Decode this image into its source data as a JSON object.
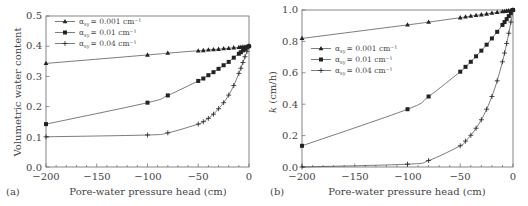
{
  "chart_data": [
    {
      "type": "line",
      "panel_label": "(a)",
      "title": "",
      "xlabel": "Pore-water pressure head (cm)",
      "ylabel": "Volumetric water content",
      "xlim": [
        -200,
        0
      ],
      "ylim": [
        0.0,
        0.5
      ],
      "xticks": [
        "-200",
        "-150",
        "-100",
        "-50",
        "0"
      ],
      "yticks": [
        "0.0",
        "0.1",
        "0.2",
        "0.3",
        "0.4",
        "0.5"
      ],
      "grid": false,
      "legend_position": "upper-left",
      "x": [
        -200,
        -100,
        -80,
        -50,
        -45,
        -40,
        -35,
        -30,
        -25,
        -20,
        -15,
        -10,
        -8,
        -6,
        -4,
        -2,
        0
      ],
      "series": [
        {
          "name": "α_sy = 0.001 cm⁻¹",
          "marker": "triangle",
          "values": [
            0.343,
            0.371,
            0.377,
            0.385,
            0.386,
            0.388,
            0.389,
            0.39,
            0.392,
            0.393,
            0.395,
            0.396,
            0.397,
            0.398,
            0.398,
            0.399,
            0.4
          ]
        },
        {
          "name": "α_sy = 0.01 cm⁻¹",
          "marker": "square",
          "values": [
            0.142,
            0.213,
            0.237,
            0.285,
            0.293,
            0.304,
            0.314,
            0.325,
            0.337,
            0.348,
            0.362,
            0.375,
            0.38,
            0.386,
            0.391,
            0.396,
            0.4
          ]
        },
        {
          "name": "α_sy = 0.04 cm⁻¹",
          "marker": "plus",
          "values": [
            0.1,
            0.106,
            0.113,
            0.142,
            0.15,
            0.161,
            0.175,
            0.193,
            0.213,
            0.238,
            0.27,
            0.31,
            0.327,
            0.346,
            0.365,
            0.383,
            0.4
          ]
        }
      ]
    },
    {
      "type": "line",
      "panel_label": "(b)",
      "title": "",
      "xlabel": "Pore-water pressure head (cm)",
      "ylabel": "k (cm/h)",
      "xlim": [
        -200,
        0
      ],
      "ylim": [
        0.0,
        1.0
      ],
      "xticks": [
        "-200",
        "-150",
        "-100",
        "-50",
        "0"
      ],
      "yticks": [
        "0.0",
        "0.2",
        "0.4",
        "0.6",
        "0.8",
        "1.0"
      ],
      "grid": false,
      "legend_position": "upper-left",
      "x": [
        -200,
        -100,
        -80,
        -50,
        -45,
        -40,
        -35,
        -30,
        -25,
        -20,
        -15,
        -10,
        -8,
        -6,
        -4,
        -2,
        0
      ],
      "series": [
        {
          "name": "α_sy = 0.001 cm⁻¹",
          "marker": "triangle",
          "values": [
            0.819,
            0.905,
            0.923,
            0.951,
            0.956,
            0.961,
            0.966,
            0.97,
            0.975,
            0.98,
            0.985,
            0.99,
            0.992,
            0.994,
            0.996,
            0.998,
            1.0
          ]
        },
        {
          "name": "α_sy = 0.01 cm⁻¹",
          "marker": "square",
          "values": [
            0.135,
            0.368,
            0.449,
            0.607,
            0.638,
            0.67,
            0.705,
            0.741,
            0.779,
            0.819,
            0.861,
            0.905,
            0.923,
            0.942,
            0.961,
            0.98,
            1.0
          ]
        },
        {
          "name": "α_sy = 0.04 cm⁻¹",
          "marker": "plus",
          "values": [
            0.0,
            0.018,
            0.041,
            0.135,
            0.165,
            0.202,
            0.247,
            0.301,
            0.368,
            0.449,
            0.549,
            0.67,
            0.726,
            0.787,
            0.852,
            0.923,
            1.0
          ]
        }
      ]
    }
  ],
  "panels": {
    "a": {
      "label": "(a)",
      "xlabel": "Pore-water pressure head (cm)",
      "ylabel": "Volumetric water content",
      "xticks": [
        "−200",
        "−150",
        "−100",
        "−50",
        "0"
      ],
      "yticks": [
        "0.0",
        "0.1",
        "0.2",
        "0.3",
        "0.4",
        "0.5"
      ],
      "legend": [
        "α",
        "α",
        "α"
      ],
      "legend_sub": [
        "sy",
        "sy",
        "sy"
      ],
      "legend_vals": [
        "= 0.001 cm⁻¹",
        "= 0.01 cm⁻¹",
        "= 0.04 cm⁻¹"
      ]
    },
    "b": {
      "label": "(b)",
      "xlabel": "Pore-water pressure head (cm)",
      "ylabel_k": "k",
      "ylabel_unit": " (cm/h)",
      "xticks": [
        "−200",
        "−150",
        "−100",
        "−50",
        "0"
      ],
      "yticks": [
        "0.0",
        "0.2",
        "0.4",
        "0.6",
        "0.8",
        "1.0"
      ],
      "legend": [
        "α",
        "α",
        "α"
      ],
      "legend_sub": [
        "sy",
        "sy",
        "sy"
      ],
      "legend_vals": [
        "= 0.001 cm⁻¹",
        "= 0.01 cm⁻¹",
        "= 0.04 cm⁻¹"
      ]
    }
  }
}
